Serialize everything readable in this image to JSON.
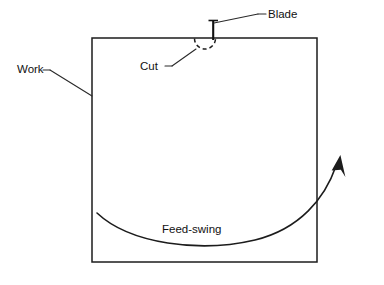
{
  "diagram": {
    "background_color": "#ffffff",
    "line_color": "#1c1c1c",
    "labels": {
      "blade": "Blade",
      "work": "Work",
      "cut": "Cut",
      "feed_swing": "Feed-swing"
    },
    "elements": {
      "workpiece": {
        "name": "Work",
        "shape": "rectangle",
        "x": 92,
        "y": 38,
        "width": 225,
        "height": 224
      },
      "blade": {
        "name": "Blade",
        "shape": "vertical-line-with-tick",
        "x": 213,
        "top_y": 19,
        "bottom_y": 40
      },
      "cut": {
        "name": "Cut",
        "shape": "dashed-arc",
        "center_x": 205,
        "center_y": 39,
        "radius": 10.5
      },
      "feed_swing": {
        "name": "Feed-swing",
        "shape": "curved-arrow",
        "start_x": 97,
        "start_y": 213,
        "end_x": 337,
        "end_y": 159
      }
    }
  }
}
